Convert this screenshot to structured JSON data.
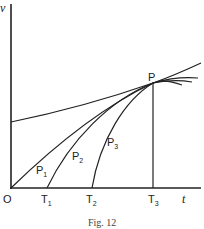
{
  "figure": {
    "caption": "Fig. 12",
    "axes": {
      "y_label": "v",
      "x_label": "t",
      "origin_label": "O"
    },
    "point_label": "P",
    "ticks": [
      {
        "label": "T",
        "sub": "1"
      },
      {
        "label": "T",
        "sub": "2"
      },
      {
        "label": "T",
        "sub": "3"
      }
    ],
    "curves": [
      {
        "label": "P",
        "sub": "1"
      },
      {
        "label": "P",
        "sub": "2"
      },
      {
        "label": "P",
        "sub": "3"
      }
    ],
    "stroke_color": "#222222"
  }
}
